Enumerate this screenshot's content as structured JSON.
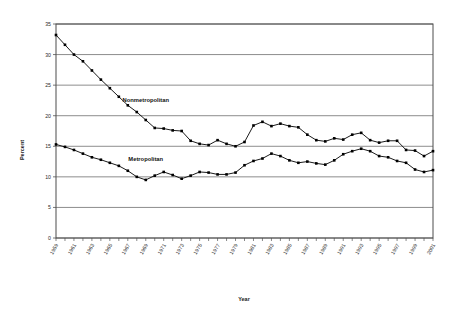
{
  "chart_data": {
    "type": "line",
    "title": "",
    "xlabel": "Year",
    "ylabel": "Percent",
    "ylim": [
      0,
      35
    ],
    "ytick_step": 5,
    "yticks": [
      0,
      5,
      10,
      15,
      20,
      25,
      30,
      35
    ],
    "xlim": [
      1959,
      2001
    ],
    "xtick_step": 2,
    "grid": "horizontal",
    "legend_position": "inline-annotation",
    "x": [
      1959,
      1960,
      1961,
      1962,
      1963,
      1964,
      1965,
      1966,
      1967,
      1968,
      1969,
      1970,
      1971,
      1972,
      1973,
      1974,
      1975,
      1976,
      1977,
      1978,
      1979,
      1980,
      1981,
      1982,
      1983,
      1984,
      1985,
      1986,
      1987,
      1988,
      1989,
      1990,
      1991,
      1992,
      1993,
      1994,
      1995,
      1996,
      1997,
      1998,
      1999,
      2000,
      2001
    ],
    "xtick_labels": [
      "1959",
      "1961",
      "1963",
      "1965",
      "1967",
      "1969",
      "1971",
      "1973",
      "1975",
      "1977",
      "1979",
      "1981",
      "1983",
      "1985",
      "1987",
      "1989",
      "1991",
      "1993",
      "1995",
      "1997",
      "1999",
      "2001"
    ],
    "series": [
      {
        "name": "Nonmetropolitan",
        "color": "#000000",
        "marker": "square",
        "values": [
          33.2,
          31.6,
          30.0,
          28.9,
          27.4,
          25.9,
          24.5,
          23.1,
          21.7,
          20.6,
          19.3,
          18.0,
          17.9,
          17.6,
          17.5,
          15.9,
          15.4,
          15.2,
          16.0,
          15.4,
          15.0,
          15.7,
          18.4,
          19.0,
          18.3,
          18.7,
          18.3,
          18.1,
          16.9,
          16.0,
          15.8,
          16.3,
          16.1,
          16.9,
          17.2,
          16.0,
          15.6,
          15.9,
          15.9,
          14.4,
          14.3,
          13.4,
          14.2
        ]
      },
      {
        "name": "Metropolitan",
        "color": "#000000",
        "marker": "square",
        "values": [
          15.3,
          14.9,
          14.4,
          13.8,
          13.2,
          12.8,
          12.3,
          11.8,
          11.0,
          10.0,
          9.5,
          10.2,
          10.8,
          10.3,
          9.7,
          10.2,
          10.8,
          10.7,
          10.4,
          10.4,
          10.7,
          11.9,
          12.6,
          13.0,
          13.8,
          13.4,
          12.7,
          12.3,
          12.5,
          12.2,
          12.0,
          12.7,
          13.7,
          14.2,
          14.6,
          14.2,
          13.4,
          13.2,
          12.6,
          12.3,
          11.2,
          10.8,
          11.1
        ]
      }
    ],
    "annotations": [
      {
        "text": "Nonmetropolitan",
        "x": 1969,
        "y": 22.3
      },
      {
        "text": "Metropolitan",
        "x": 1969,
        "y": 12.6
      }
    ]
  },
  "axes": {
    "x_title": "Year",
    "y_title": "Percent"
  }
}
